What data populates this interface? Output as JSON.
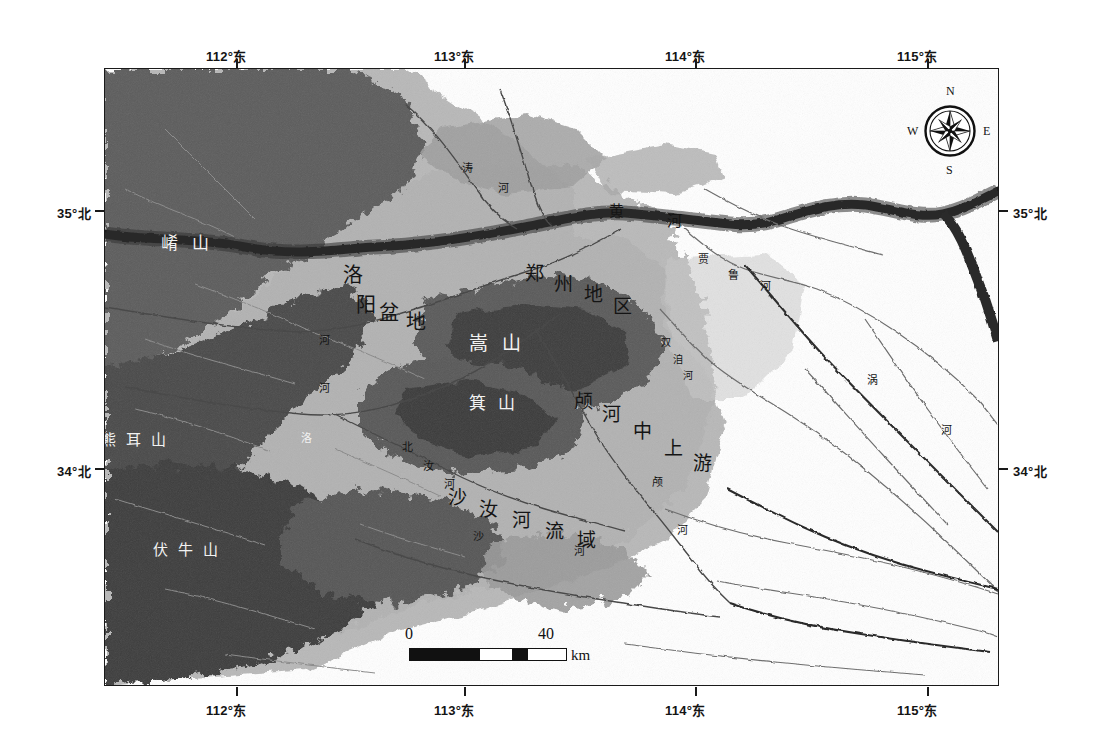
{
  "figure": {
    "kind": "thematic-relief-map",
    "region": "黄河中游地区",
    "frame_color": "#1a1a1a",
    "background": "#ffffff"
  },
  "axes": {
    "top": [
      {
        "label": "112°东",
        "x_px": 236
      },
      {
        "label": "113°东",
        "x_px": 464
      },
      {
        "label": "114°东",
        "x_px": 695
      },
      {
        "label": "115°东",
        "x_px": 927
      }
    ],
    "bottom": [
      {
        "label": "112°东",
        "x_px": 236
      },
      {
        "label": "113°东",
        "x_px": 464
      },
      {
        "label": "114°东",
        "x_px": 695
      },
      {
        "label": "115°东",
        "x_px": 927
      }
    ],
    "left": [
      {
        "label": "35°北",
        "y_px": 210
      },
      {
        "label": "34°北",
        "y_px": 468
      }
    ],
    "right": [
      {
        "label": "35°北",
        "y_px": 210
      },
      {
        "label": "34°北",
        "y_px": 468
      }
    ]
  },
  "compass": {
    "name": "compass-rose",
    "north": "N",
    "south": "S",
    "east": "E",
    "west": "W"
  },
  "scale_bar": {
    "start": "0",
    "end": "40",
    "unit": "km"
  },
  "map_labels": [
    {
      "text": "崤山",
      "x": 160,
      "y": 228,
      "size": 17,
      "tone": "light",
      "orient": "h",
      "ls": 14
    },
    {
      "text": "熊耳山",
      "x": 100,
      "y": 427,
      "size": 15,
      "tone": "light",
      "orient": "h",
      "ls": 10
    },
    {
      "text": "伏牛山",
      "x": 152,
      "y": 537,
      "size": 15,
      "tone": "light",
      "orient": "h",
      "ls": 10
    },
    {
      "text": "洛",
      "x": 342,
      "y": 258,
      "size": 20,
      "tone": "dark",
      "orient": "h",
      "ls": 0
    },
    {
      "text": "阳",
      "x": 355,
      "y": 288,
      "size": 20,
      "tone": "dark",
      "orient": "h",
      "ls": 0
    },
    {
      "text": "盆",
      "x": 378,
      "y": 296,
      "size": 20,
      "tone": "dark",
      "orient": "h",
      "ls": 0
    },
    {
      "text": "地",
      "x": 405,
      "y": 305,
      "size": 20,
      "tone": "dark",
      "orient": "h",
      "ls": 0
    },
    {
      "text": "郑",
      "x": 524,
      "y": 257,
      "size": 19,
      "tone": "dark",
      "orient": "h",
      "ls": 0
    },
    {
      "text": "州",
      "x": 553,
      "y": 268,
      "size": 19,
      "tone": "dark",
      "orient": "h",
      "ls": 0
    },
    {
      "text": "地",
      "x": 583,
      "y": 278,
      "size": 19,
      "tone": "dark",
      "orient": "h",
      "ls": 0
    },
    {
      "text": "区",
      "x": 612,
      "y": 290,
      "size": 19,
      "tone": "dark",
      "orient": "h",
      "ls": 0
    },
    {
      "text": "嵩山",
      "x": 468,
      "y": 327,
      "size": 19,
      "tone": "light",
      "orient": "h",
      "ls": 14
    },
    {
      "text": "箕山",
      "x": 468,
      "y": 388,
      "size": 17,
      "tone": "light",
      "orient": "h",
      "ls": 12
    },
    {
      "text": "颅",
      "x": 573,
      "y": 385,
      "size": 19,
      "tone": "dark",
      "orient": "h",
      "ls": 0
    },
    {
      "text": "河",
      "x": 601,
      "y": 398,
      "size": 19,
      "tone": "dark",
      "orient": "h",
      "ls": 0
    },
    {
      "text": "中",
      "x": 632,
      "y": 415,
      "size": 19,
      "tone": "dark",
      "orient": "h",
      "ls": 0
    },
    {
      "text": "上",
      "x": 663,
      "y": 432,
      "size": 19,
      "tone": "dark",
      "orient": "h",
      "ls": 0
    },
    {
      "text": "游",
      "x": 692,
      "y": 447,
      "size": 19,
      "tone": "dark",
      "orient": "h",
      "ls": 0
    },
    {
      "text": "沙",
      "x": 447,
      "y": 481,
      "size": 19,
      "tone": "dark",
      "orient": "h",
      "ls": 0
    },
    {
      "text": "汝",
      "x": 478,
      "y": 493,
      "size": 19,
      "tone": "dark",
      "orient": "h",
      "ls": 0
    },
    {
      "text": "河",
      "x": 511,
      "y": 504,
      "size": 19,
      "tone": "dark",
      "orient": "h",
      "ls": 0
    },
    {
      "text": "流",
      "x": 544,
      "y": 515,
      "size": 19,
      "tone": "dark",
      "orient": "h",
      "ls": 0
    },
    {
      "text": "域",
      "x": 576,
      "y": 524,
      "size": 19,
      "tone": "dark",
      "orient": "h",
      "ls": 0
    },
    {
      "text": "黄",
      "x": 608,
      "y": 198,
      "size": 15,
      "tone": "dark",
      "orient": "h",
      "ls": 0
    },
    {
      "text": "河",
      "x": 666,
      "y": 208,
      "size": 15,
      "tone": "dark",
      "orient": "h",
      "ls": 0
    },
    {
      "text": "涛",
      "x": 461,
      "y": 158,
      "size": 11,
      "tone": "dark",
      "orient": "h",
      "ls": 0
    },
    {
      "text": "河",
      "x": 497,
      "y": 178,
      "size": 11,
      "tone": "dark",
      "orient": "h",
      "ls": 0
    },
    {
      "text": "贾",
      "x": 697,
      "y": 249,
      "size": 11,
      "tone": "dark",
      "orient": "h",
      "ls": 0
    },
    {
      "text": "鲁",
      "x": 727,
      "y": 265,
      "size": 11,
      "tone": "dark",
      "orient": "h",
      "ls": 0
    },
    {
      "text": "河",
      "x": 759,
      "y": 276,
      "size": 11,
      "tone": "dark",
      "orient": "h",
      "ls": 0
    },
    {
      "text": "双",
      "x": 660,
      "y": 333,
      "size": 10,
      "tone": "dark",
      "orient": "h",
      "ls": 0
    },
    {
      "text": "洎",
      "x": 672,
      "y": 350,
      "size": 10,
      "tone": "dark",
      "orient": "h",
      "ls": 0
    },
    {
      "text": "河",
      "x": 682,
      "y": 366,
      "size": 10,
      "tone": "dark",
      "orient": "h",
      "ls": 0
    },
    {
      "text": "涡",
      "x": 866,
      "y": 370,
      "size": 11,
      "tone": "dark",
      "orient": "h",
      "ls": 0
    },
    {
      "text": "河",
      "x": 940,
      "y": 420,
      "size": 11,
      "tone": "dark",
      "orient": "h",
      "ls": 0
    },
    {
      "text": "北",
      "x": 401,
      "y": 437,
      "size": 11,
      "tone": "dark",
      "orient": "h",
      "ls": 0
    },
    {
      "text": "汝",
      "x": 422,
      "y": 456,
      "size": 11,
      "tone": "dark",
      "orient": "h",
      "ls": 0
    },
    {
      "text": "河",
      "x": 443,
      "y": 474,
      "size": 11,
      "tone": "dark",
      "orient": "h",
      "ls": 0
    },
    {
      "text": "颅",
      "x": 651,
      "y": 472,
      "size": 11,
      "tone": "dark",
      "orient": "h",
      "ls": 0
    },
    {
      "text": "河",
      "x": 676,
      "y": 520,
      "size": 11,
      "tone": "dark",
      "orient": "h",
      "ls": 0
    },
    {
      "text": "河",
      "x": 573,
      "y": 541,
      "size": 11,
      "tone": "dark",
      "orient": "h",
      "ls": 0
    },
    {
      "text": "沙",
      "x": 472,
      "y": 526,
      "size": 11,
      "tone": "dark",
      "orient": "h",
      "ls": 0
    },
    {
      "text": "河",
      "x": 318,
      "y": 330,
      "size": 11,
      "tone": "dark",
      "orient": "h",
      "ls": 0
    },
    {
      "text": "河",
      "x": 318,
      "y": 378,
      "size": 11,
      "tone": "dark",
      "orient": "h",
      "ls": 0
    },
    {
      "text": "洛",
      "x": 300,
      "y": 428,
      "size": 11,
      "tone": "light",
      "orient": "h",
      "ls": 0
    }
  ],
  "chart_data": {
    "type": "map",
    "title": "",
    "projection": "geographic",
    "xlabel": "",
    "ylabel": "",
    "xlim": [
      111.55,
      115.35
    ],
    "ylim": [
      33.35,
      35.45
    ],
    "grid": false,
    "x_ticks": [
      112,
      113,
      114,
      115
    ],
    "x_ticklabels": [
      "112°东",
      "113°东",
      "114°东",
      "115°东"
    ],
    "y_ticks": [
      34,
      35
    ],
    "y_ticklabels": [
      "34°北",
      "35°北"
    ],
    "legend": [],
    "annotations": [
      "崤山",
      "熊耳山",
      "伏牛山",
      "洛阳盆地",
      "郑州地区",
      "嵩山",
      "箕山",
      "颅河中上游",
      "沙汝河流域",
      "黄河",
      "贾鲁河",
      "双洎河",
      "涡河",
      "北汝河",
      "洛河"
    ],
    "scalebar_km": 40
  }
}
